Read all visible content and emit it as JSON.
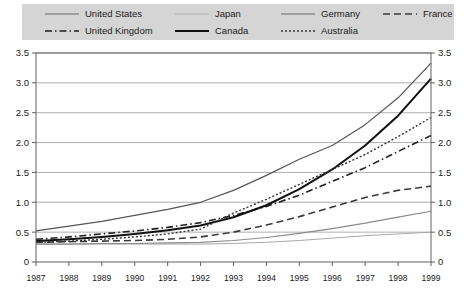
{
  "legend": {
    "rows": [
      [
        {
          "label": "United States",
          "style": "solid-medium"
        },
        {
          "label": "Japan",
          "style": "solid-thin-light"
        },
        {
          "label": "Germany",
          "style": "solid-medium"
        },
        {
          "label": "France",
          "style": "dashed"
        }
      ],
      [
        {
          "label": "United Kingdom",
          "style": "dash-dot"
        },
        {
          "label": "Canada",
          "style": "solid-thick"
        },
        {
          "label": "Australia",
          "style": "dotted"
        }
      ]
    ],
    "background": "#d5d5d5"
  },
  "axes": {
    "y_ticks": [
      "0",
      "0.5",
      "1.0",
      "1.5",
      "2.0",
      "2.5",
      "3.0",
      "3.5"
    ],
    "y_ticks_right": [
      "0",
      "0.5",
      "1.0",
      "1.5",
      "2.0",
      "2.5",
      "3.0",
      "3.5"
    ],
    "x_ticks": [
      "1987",
      "1988",
      "1989",
      "1990",
      "1991",
      "1992",
      "1993",
      "1994",
      "1995",
      "1996",
      "1997",
      "1998",
      "1999"
    ]
  },
  "chart_data": {
    "type": "line",
    "title": "",
    "xlabel": "",
    "ylabel": "",
    "ylim": [
      0,
      3.5
    ],
    "grid": true,
    "legend_position": "top",
    "x": [
      1987,
      1988,
      1989,
      1990,
      1991,
      1992,
      1993,
      1994,
      1995,
      1996,
      1997,
      1998,
      1999
    ],
    "series": [
      {
        "name": "United States",
        "style": "solid-medium",
        "color": "#555555",
        "values": [
          0.52,
          0.6,
          0.68,
          0.78,
          0.88,
          1.0,
          1.2,
          1.45,
          1.72,
          1.95,
          2.3,
          2.75,
          3.33
        ]
      },
      {
        "name": "Japan",
        "style": "solid-thin-light",
        "color": "#a8a8a8",
        "values": [
          0.3,
          0.3,
          0.3,
          0.3,
          0.3,
          0.3,
          0.31,
          0.33,
          0.36,
          0.4,
          0.44,
          0.47,
          0.5
        ]
      },
      {
        "name": "Germany",
        "style": "solid-medium",
        "color": "#8a8a8a",
        "values": [
          0.3,
          0.3,
          0.31,
          0.31,
          0.32,
          0.33,
          0.36,
          0.41,
          0.48,
          0.56,
          0.65,
          0.75,
          0.85
        ]
      },
      {
        "name": "France",
        "style": "dashed",
        "color": "#3a3a3a",
        "values": [
          0.33,
          0.34,
          0.35,
          0.36,
          0.38,
          0.42,
          0.5,
          0.62,
          0.76,
          0.92,
          1.08,
          1.2,
          1.27
        ]
      },
      {
        "name": "United Kingdom",
        "style": "dash-dot",
        "color": "#222222",
        "values": [
          0.38,
          0.42,
          0.47,
          0.52,
          0.58,
          0.66,
          0.78,
          0.93,
          1.12,
          1.35,
          1.58,
          1.85,
          2.12
        ]
      },
      {
        "name": "Canada",
        "style": "solid-thick",
        "color": "#111111",
        "values": [
          0.35,
          0.38,
          0.42,
          0.47,
          0.53,
          0.61,
          0.75,
          0.95,
          1.22,
          1.55,
          1.95,
          2.45,
          3.07
        ]
      },
      {
        "name": "Australia",
        "style": "dotted",
        "color": "#333333",
        "values": [
          0.33,
          0.35,
          0.38,
          0.42,
          0.47,
          0.55,
          0.82,
          1.05,
          1.3,
          1.55,
          1.8,
          2.1,
          2.42
        ]
      }
    ]
  }
}
